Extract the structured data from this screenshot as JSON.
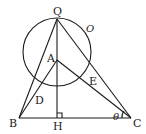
{
  "diagram": {
    "points": {
      "Q": {
        "label": "Q",
        "x": 57,
        "y": 19
      },
      "A": {
        "label": "A",
        "x": 57,
        "y": 60
      },
      "B": {
        "label": "B",
        "x": 19,
        "y": 118
      },
      "C": {
        "label": "C",
        "x": 131,
        "y": 118
      },
      "H": {
        "label": "H",
        "x": 57,
        "y": 118
      },
      "D": {
        "label": "D",
        "x": 37,
        "y": 91
      },
      "E": {
        "label": "E",
        "x": 90,
        "y": 77
      }
    },
    "circle": {
      "label": "O",
      "cx": 57,
      "cy": 52,
      "r": 34
    },
    "angle": {
      "label": "θ",
      "at": "C"
    },
    "right_angle_at": "H"
  }
}
